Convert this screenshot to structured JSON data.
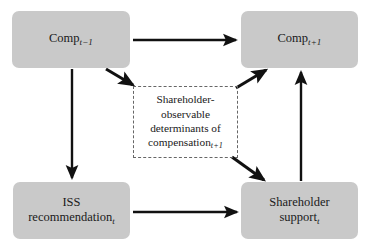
{
  "diagram": {
    "colors": {
      "node_fill": "#c9c9c9",
      "dashed_border": "#666666",
      "arrow": "#111111",
      "background": "#ffffff",
      "text": "#1a1a1a"
    },
    "nodes": [
      {
        "id": "comp-prev",
        "name": "comp-t-minus-1",
        "style": "solid",
        "lines": [
          "Comp"
        ],
        "base": "Comp",
        "subscript": "t−1",
        "full_text": "Comp t−1"
      },
      {
        "id": "comp-next",
        "name": "comp-t-plus-1",
        "style": "solid",
        "base": "Comp",
        "subscript": "t+1",
        "full_text": "Comp t+1"
      },
      {
        "id": "iss-recommendation",
        "name": "iss-recommendation-t",
        "style": "solid",
        "line1": "ISS",
        "base": "recommendation",
        "subscript": "t",
        "full_text": "ISS recommendation t"
      },
      {
        "id": "shareholder-support",
        "name": "shareholder-support-t",
        "style": "solid",
        "line1": "Shareholder",
        "base": "support",
        "subscript": "t",
        "full_text": "Shareholder support t"
      },
      {
        "id": "determinants",
        "name": "shareholder-observable-determinants",
        "style": "dashed",
        "line1": "Shareholder-",
        "line2": "observable",
        "line3": "determinants of",
        "base": "compensation",
        "subscript": "t+1",
        "full_text": "Shareholder-observable determinants of compensation t+1"
      }
    ],
    "edges": [
      {
        "id": "e1",
        "name": "arrow-comp-prev-to-comp-next",
        "from": "comp-prev",
        "to": "comp-next",
        "kind": "horizontal"
      },
      {
        "id": "e2",
        "name": "arrow-comp-prev-to-iss-recommendation",
        "from": "comp-prev",
        "to": "iss-recommendation",
        "kind": "vertical"
      },
      {
        "id": "e3",
        "name": "arrow-comp-prev-to-determinants",
        "from": "comp-prev",
        "to": "determinants",
        "kind": "diagonal"
      },
      {
        "id": "e4",
        "name": "arrow-determinants-to-comp-next",
        "from": "determinants",
        "to": "comp-next",
        "kind": "diagonal"
      },
      {
        "id": "e5",
        "name": "arrow-determinants-to-shareholder-support",
        "from": "determinants",
        "to": "shareholder-support",
        "kind": "diagonal"
      },
      {
        "id": "e6",
        "name": "arrow-iss-recommendation-to-shareholder-support",
        "from": "iss-recommendation",
        "to": "shareholder-support",
        "kind": "horizontal"
      },
      {
        "id": "e7",
        "name": "arrow-shareholder-support-to-comp-next",
        "from": "shareholder-support",
        "to": "comp-next",
        "kind": "vertical"
      }
    ]
  }
}
